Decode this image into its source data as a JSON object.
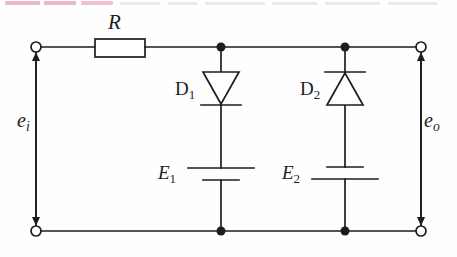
{
  "figure": {
    "background_color": "#fefefe",
    "line_color": "#1d1d1d",
    "width": 457,
    "height": 257
  },
  "labels": {
    "resistor": "R",
    "diode1_base": "D",
    "diode1_sub": "1",
    "diode2_base": "D",
    "diode2_sub": "2",
    "battery1_base": "E",
    "battery1_sub": "1",
    "battery2_base": "E",
    "battery2_sub": "2",
    "input_base": "e",
    "input_sub": "i",
    "output_base": "e",
    "output_sub": "o"
  },
  "components": {
    "resistor": {
      "name": "R",
      "type": "resistor",
      "orientation": "horizontal",
      "box": {
        "x": 95,
        "y": 40,
        "width": 50,
        "height": 18
      }
    },
    "diode1": {
      "name": "D1",
      "type": "diode",
      "orientation": "cathode-down",
      "conducts": "downward",
      "branch_x": 221,
      "triangle": {
        "top_y": 72,
        "bottom_y": 104,
        "half_width": 18
      },
      "cathode_bar_y": 105
    },
    "diode2": {
      "name": "D2",
      "type": "diode",
      "orientation": "cathode-up",
      "conducts": "upward",
      "branch_x": 345,
      "triangle": {
        "top_y": 73,
        "bottom_y": 105,
        "half_width": 18
      },
      "cathode_bar_y": 72
    },
    "battery1": {
      "name": "E1",
      "type": "battery",
      "branch_x": 221,
      "long_plate": {
        "y": 168,
        "half_width": 33
      },
      "short_plate": {
        "y": 180,
        "half_width": 18
      },
      "polarity": "positive-up"
    },
    "battery2": {
      "name": "E2",
      "type": "battery",
      "branch_x": 345,
      "short_plate": {
        "y": 167,
        "half_width": 18
      },
      "long_plate": {
        "y": 179,
        "half_width": 33
      },
      "polarity": "negative-up"
    }
  },
  "terminals": {
    "input_top": {
      "x": 36,
      "y": 47,
      "style": "open-circle"
    },
    "input_bottom": {
      "x": 36,
      "y": 231,
      "style": "open-circle"
    },
    "output_top": {
      "x": 421,
      "y": 47,
      "style": "open-circle"
    },
    "output_bottom": {
      "x": 421,
      "y": 231,
      "style": "open-circle"
    }
  },
  "voltage_arrows": {
    "input": {
      "x": 36,
      "top_y": 55,
      "bottom_y": 223,
      "heads": "both"
    },
    "output": {
      "x": 421,
      "top_y": 55,
      "bottom_y": 223,
      "heads": "both"
    }
  },
  "nodes": [
    {
      "name": "top-node-1",
      "x": 221,
      "y": 47
    },
    {
      "name": "top-node-2",
      "x": 345,
      "y": 47
    },
    {
      "name": "bottom-node-1",
      "x": 221,
      "y": 231
    },
    {
      "name": "bottom-node-2",
      "x": 345,
      "y": 231
    }
  ],
  "rails": {
    "top_y": 47,
    "bottom_y": 231,
    "left_x": 36,
    "right_x": 421
  },
  "page_artifacts": {
    "highlight_color": "#f0b8cd",
    "strips": [
      {
        "x": 5,
        "width": 35,
        "color": "#f0b8cd"
      },
      {
        "x": 44,
        "width": 32,
        "color": "#eeb6cb"
      },
      {
        "x": 81,
        "width": 32,
        "color": "#f2c2d3"
      }
    ],
    "gray_strips": [
      {
        "x": 120,
        "width": 40
      },
      {
        "x": 168,
        "width": 30
      },
      {
        "x": 205,
        "width": 60
      },
      {
        "x": 272,
        "width": 45
      },
      {
        "x": 325,
        "width": 55
      },
      {
        "x": 388,
        "width": 50
      }
    ]
  }
}
